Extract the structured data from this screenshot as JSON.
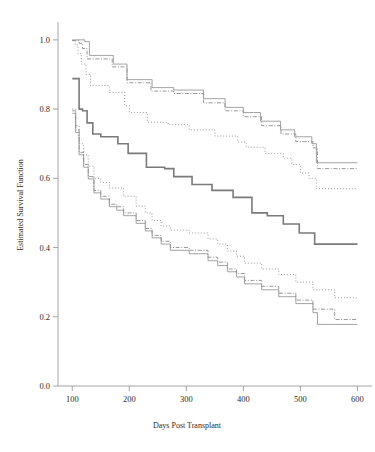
{
  "figure": {
    "name": "kaplan-meier-survival-plot",
    "background_color": "#ffffff",
    "axis_color": "#9a9a9a",
    "text_color": "#2b2b2b"
  },
  "chart_data": {
    "type": "line",
    "title": "",
    "subtitle": "",
    "xlabel": "Days Post Transplant",
    "ylabel": "Estimated Survival Function",
    "xlim": [
      75,
      615
    ],
    "ylim": [
      0.0,
      1.04
    ],
    "grid": false,
    "legend": "none",
    "xticks": [
      100,
      200,
      300,
      400,
      500,
      600
    ],
    "xtick_labels": [
      "100",
      "200",
      "300",
      "400",
      "500",
      "600"
    ],
    "yticks": [
      0.0,
      0.2,
      0.4,
      0.6,
      0.8,
      1.0
    ],
    "ytick_labels": [
      "0.0",
      "0.2",
      "0.4",
      "0.6",
      "0.8",
      "1.0"
    ],
    "step_type": "post",
    "series": [
      {
        "name": "upper-band-solid",
        "style": "solid",
        "color": "#8c8c8c",
        "width": 0.8,
        "x": [
          100,
          108,
          115,
          122,
          130,
          145,
          160,
          172,
          190,
          196,
          205,
          228,
          240,
          262,
          278,
          300,
          330,
          345,
          368,
          385,
          400,
          418,
          430,
          448,
          465,
          478,
          490,
          505,
          520,
          528,
          560,
          600
        ],
        "y": [
          1.0,
          1.0,
          1.0,
          0.995,
          0.955,
          0.955,
          0.955,
          0.93,
          0.93,
          0.885,
          0.885,
          0.885,
          0.862,
          0.862,
          0.855,
          0.855,
          0.83,
          0.83,
          0.805,
          0.805,
          0.79,
          0.79,
          0.765,
          0.765,
          0.74,
          0.74,
          0.72,
          0.72,
          0.7,
          0.645,
          0.645,
          0.645
        ]
      },
      {
        "name": "upper-band-dashdot",
        "style": "dashdot",
        "color": "#8c8c8c",
        "width": 0.9,
        "x": [
          100,
          106,
          112,
          118,
          126,
          140,
          158,
          170,
          190,
          196,
          208,
          228,
          238,
          260,
          278,
          300,
          330,
          348,
          368,
          386,
          400,
          418,
          432,
          450,
          466,
          480,
          492,
          508,
          522,
          530,
          562,
          600
        ],
        "y": [
          0.998,
          0.998,
          0.99,
          0.975,
          0.945,
          0.945,
          0.945,
          0.922,
          0.922,
          0.876,
          0.876,
          0.876,
          0.852,
          0.852,
          0.845,
          0.845,
          0.818,
          0.818,
          0.795,
          0.795,
          0.778,
          0.778,
          0.752,
          0.752,
          0.728,
          0.728,
          0.706,
          0.706,
          0.688,
          0.628,
          0.628,
          0.628
        ]
      },
      {
        "name": "upper-band-dotted",
        "style": "dotted",
        "color": "#8c8c8c",
        "width": 0.9,
        "x": [
          100,
          105,
          110,
          116,
          124,
          132,
          148,
          165,
          180,
          192,
          200,
          215,
          232,
          250,
          268,
          285,
          305,
          330,
          350,
          372,
          390,
          405,
          420,
          438,
          455,
          470,
          485,
          500,
          515,
          528,
          560,
          600
        ],
        "y": [
          0.998,
          0.985,
          0.96,
          0.93,
          0.9,
          0.868,
          0.868,
          0.848,
          0.848,
          0.81,
          0.79,
          0.79,
          0.762,
          0.762,
          0.755,
          0.755,
          0.74,
          0.74,
          0.722,
          0.722,
          0.705,
          0.69,
          0.69,
          0.672,
          0.672,
          0.658,
          0.64,
          0.615,
          0.6,
          0.57,
          0.57,
          0.57
        ]
      },
      {
        "name": "median-survival-solid-bold",
        "style": "solid",
        "color": "#7a7a7a",
        "width": 1.6,
        "x": [
          100,
          105,
          112,
          118,
          126,
          136,
          150,
          165,
          180,
          192,
          198,
          215,
          230,
          245,
          262,
          278,
          295,
          310,
          330,
          345,
          362,
          382,
          398,
          415,
          428,
          442,
          458,
          470,
          485,
          498,
          512,
          525,
          560,
          600
        ],
        "y": [
          0.888,
          0.888,
          0.8,
          0.795,
          0.76,
          0.728,
          0.72,
          0.72,
          0.7,
          0.7,
          0.672,
          0.672,
          0.632,
          0.632,
          0.628,
          0.605,
          0.605,
          0.582,
          0.582,
          0.565,
          0.565,
          0.545,
          0.545,
          0.5,
          0.5,
          0.492,
          0.492,
          0.468,
          0.468,
          0.442,
          0.442,
          0.41,
          0.41,
          0.41
        ]
      },
      {
        "name": "lower-band-dotted",
        "style": "dotted",
        "color": "#8c8c8c",
        "width": 0.9,
        "x": [
          100,
          106,
          112,
          120,
          128,
          138,
          150,
          165,
          178,
          190,
          200,
          212,
          228,
          240,
          256,
          272,
          288,
          305,
          322,
          338,
          355,
          372,
          388,
          402,
          418,
          432,
          448,
          462,
          478,
          492,
          508,
          522,
          560,
          600
        ],
        "y": [
          0.8,
          0.752,
          0.7,
          0.668,
          0.635,
          0.6,
          0.588,
          0.572,
          0.572,
          0.548,
          0.548,
          0.52,
          0.5,
          0.478,
          0.462,
          0.45,
          0.45,
          0.442,
          0.442,
          0.425,
          0.41,
          0.39,
          0.375,
          0.355,
          0.355,
          0.338,
          0.338,
          0.322,
          0.322,
          0.3,
          0.3,
          0.278,
          0.255,
          0.255
        ]
      },
      {
        "name": "lower-band-dashdot",
        "style": "dashdot",
        "color": "#8c8c8c",
        "width": 0.9,
        "x": [
          100,
          106,
          112,
          120,
          128,
          138,
          150,
          165,
          178,
          190,
          200,
          212,
          228,
          240,
          256,
          272,
          288,
          305,
          322,
          338,
          355,
          372,
          388,
          402,
          418,
          432,
          448,
          462,
          478,
          492,
          508,
          522,
          560,
          600
        ],
        "y": [
          0.795,
          0.74,
          0.675,
          0.64,
          0.605,
          0.565,
          0.548,
          0.525,
          0.518,
          0.5,
          0.5,
          0.478,
          0.455,
          0.435,
          0.418,
          0.4,
          0.4,
          0.392,
          0.392,
          0.372,
          0.358,
          0.338,
          0.325,
          0.305,
          0.305,
          0.288,
          0.288,
          0.268,
          0.268,
          0.248,
          0.248,
          0.222,
          0.192,
          0.192
        ]
      },
      {
        "name": "lower-band-solid",
        "style": "solid",
        "color": "#8c8c8c",
        "width": 0.8,
        "x": [
          100,
          106,
          112,
          120,
          128,
          138,
          150,
          165,
          178,
          190,
          200,
          212,
          228,
          240,
          256,
          272,
          288,
          305,
          322,
          338,
          355,
          372,
          388,
          402,
          418,
          432,
          448,
          462,
          478,
          492,
          508,
          522,
          530,
          560,
          600
        ],
        "y": [
          0.788,
          0.732,
          0.668,
          0.632,
          0.598,
          0.558,
          0.54,
          0.518,
          0.508,
          0.492,
          0.492,
          0.47,
          0.448,
          0.428,
          0.41,
          0.392,
          0.392,
          0.382,
          0.382,
          0.362,
          0.348,
          0.33,
          0.315,
          0.295,
          0.295,
          0.278,
          0.278,
          0.258,
          0.258,
          0.238,
          0.238,
          0.212,
          0.178,
          0.178,
          0.178
        ]
      }
    ]
  }
}
